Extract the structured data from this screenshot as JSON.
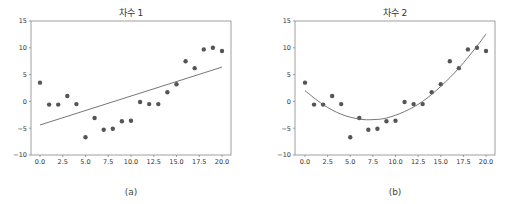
{
  "chart_data": [
    {
      "type": "scatter",
      "title": "차수 1",
      "caption": "(a)",
      "xlabel": "",
      "ylabel": "",
      "xlim": [
        -1,
        21
      ],
      "ylim": [
        -10,
        15
      ],
      "xticks": [
        "0.0",
        "2.5",
        "5.0",
        "7.5",
        "10.0",
        "12.5",
        "15.0",
        "17.5",
        "20.0"
      ],
      "yticks": [
        "-10",
        "-5",
        "0",
        "5",
        "10",
        "15"
      ],
      "series": [
        {
          "name": "data",
          "type": "scatter",
          "x": [
            0,
            1,
            2,
            3,
            4,
            5,
            6,
            7,
            8,
            9,
            10,
            11,
            12,
            13,
            14,
            15,
            16,
            17,
            18,
            19,
            20
          ],
          "y": [
            3.5,
            -0.6,
            -0.6,
            1.0,
            -0.5,
            -6.7,
            -3.1,
            -5.3,
            -5.1,
            -3.7,
            -3.6,
            -0.1,
            -0.5,
            -0.5,
            1.7,
            3.2,
            7.5,
            6.2,
            9.7,
            10.0,
            9.4
          ]
        },
        {
          "name": "fit degree 1",
          "type": "line",
          "x": [
            0,
            20
          ],
          "y": [
            -4.4,
            6.4
          ]
        }
      ]
    },
    {
      "type": "scatter",
      "title": "차수 2",
      "caption": "(b)",
      "xlabel": "",
      "ylabel": "",
      "xlim": [
        -1,
        21
      ],
      "ylim": [
        -10,
        15
      ],
      "xticks": [
        "0.0",
        "2.5",
        "5.0",
        "7.5",
        "10.0",
        "12.5",
        "15.0",
        "17.5",
        "20.0"
      ],
      "yticks": [
        "-10",
        "-5",
        "0",
        "5",
        "10",
        "15"
      ],
      "series": [
        {
          "name": "data",
          "type": "scatter",
          "x": [
            0,
            1,
            2,
            3,
            4,
            5,
            6,
            7,
            8,
            9,
            10,
            11,
            12,
            13,
            14,
            15,
            16,
            17,
            18,
            19,
            20
          ],
          "y": [
            3.5,
            -0.6,
            -0.6,
            1.0,
            -0.5,
            -6.7,
            -3.1,
            -5.3,
            -5.1,
            -3.7,
            -3.6,
            -0.1,
            -0.5,
            -0.5,
            1.7,
            3.2,
            7.5,
            6.2,
            9.7,
            10.0,
            9.4
          ]
        },
        {
          "name": "fit degree 2",
          "type": "line",
          "x": [
            0,
            2,
            4,
            6,
            7.5,
            9,
            11,
            13,
            15,
            17,
            19,
            20
          ],
          "y": [
            2.0,
            -0.6,
            -2.4,
            -3.3,
            -3.4,
            -3.1,
            -1.9,
            0.0,
            2.8,
            6.2,
            10.3,
            12.6
          ]
        }
      ]
    }
  ],
  "colors": {
    "point": "#555555",
    "line": "#666666",
    "axis": "#888888"
  }
}
